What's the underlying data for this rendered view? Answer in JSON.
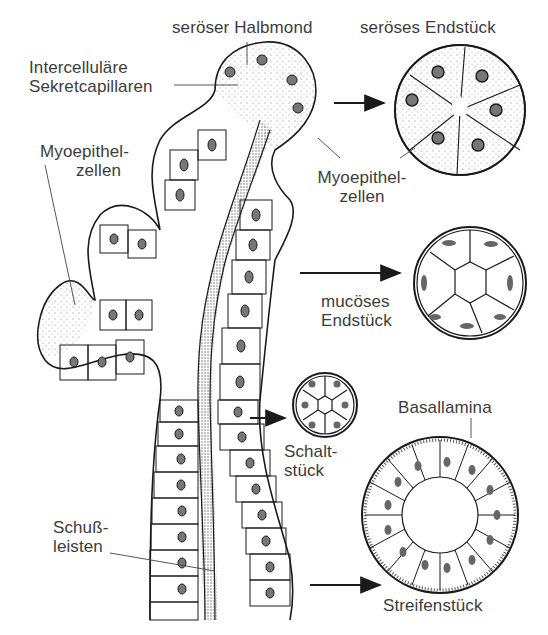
{
  "diagram": {
    "type": "anatomical illustration",
    "labels": {
      "seroeser_halbmond": "seröser Halbmond",
      "seroeses_endstueck": "seröses Endstück",
      "intercellulaere_1": "Intercelluläre",
      "intercellulaere_2": "Sekretcapillaren",
      "myoepithel_left_1": "Myoepithel-",
      "myoepithel_left_2": "zellen",
      "myoepithel_right_1": "Myoepithel-",
      "myoepithel_right_2": "zellen",
      "mucoeses_1": "mucöses",
      "mucoeses_2": "Endstück",
      "basallamina": "Basallamina",
      "schalt_1": "Schalt-",
      "schalt_2": "stück",
      "schuss_1": "Schuß-",
      "schuss_2": "leisten",
      "streifenstueck": "Streifenstück"
    },
    "cross_sections": [
      {
        "name": "seröses Endstück",
        "cells": 6
      },
      {
        "name": "mucöses Endstück",
        "cells": 7
      },
      {
        "name": "Schaltstück",
        "cells": 6
      },
      {
        "name": "Streifenstück",
        "cells": 16
      }
    ],
    "colors": {
      "ink": "#1a1a1a",
      "label_text": "#3c3c3c",
      "stipple": "#8a8a8a",
      "background": "#ffffff"
    }
  }
}
